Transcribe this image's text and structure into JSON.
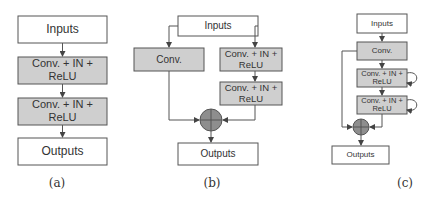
{
  "figure": {
    "panels": [
      {
        "id": "a",
        "caption": "(a)",
        "description": "Plain sequential block",
        "nodes": {
          "inputs": "Inputs",
          "block1_line1": "Conv. + IN +",
          "block1_line2": "ReLU",
          "block2_line1": "Conv. + IN +",
          "block2_line2": "ReLU",
          "outputs": "Outputs"
        }
      },
      {
        "id": "b",
        "caption": "(b)",
        "description": "Residual block with conv shortcut",
        "nodes": {
          "inputs": "Inputs",
          "shortcut": "Conv.",
          "block1_line1": "Conv. + IN +",
          "block1_line2": "ReLU",
          "block2_line1": "Conv. + IN +",
          "block2_line2": "ReLU",
          "sum": "+",
          "outputs": "Outputs"
        }
      },
      {
        "id": "c",
        "caption": "(c)",
        "description": "Recurrent residual block",
        "nodes": {
          "inputs": "Inputs",
          "conv": "Conv.",
          "block1_line1": "Conv. + IN +",
          "block1_line2": "ReLU",
          "block2_line1": "Conv. + IN +",
          "block2_line2": "ReLU",
          "sum": "+",
          "outputs": "Outputs"
        }
      }
    ],
    "colors": {
      "box_fill_gray": "#cfcfcf",
      "box_fill_white": "#ffffff",
      "stroke": "#555555",
      "sum_node": "#8e8e8e"
    }
  }
}
